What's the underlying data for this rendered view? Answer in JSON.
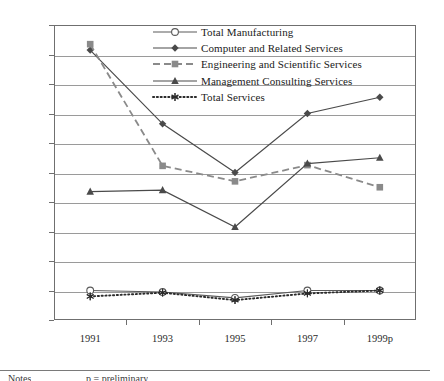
{
  "chart_data": {
    "type": "line",
    "title": "",
    "xlabel": "",
    "ylabel": "",
    "categories": [
      "1991",
      "1993",
      "1995",
      "1997",
      "1999p"
    ],
    "ylim": [
      0,
      20
    ],
    "ytick_step": 2,
    "ytick_labels": [
      "0.00",
      "2.00",
      "4.00",
      "6.00",
      "8.00",
      "10.00",
      "12.00",
      "14.00",
      "16.00",
      "18.00",
      "20.00"
    ],
    "grid": true,
    "legend_position": "top-center",
    "series": [
      {
        "name": "Total Manufacturing",
        "values": [
          2.0,
          1.9,
          1.5,
          2.0,
          2.0
        ],
        "marker": "open-circle",
        "line_style": "solid",
        "color": "#5a5a5a"
      },
      {
        "name": "Computer and Related Services",
        "values": [
          18.3,
          13.3,
          10.0,
          14.0,
          15.1
        ],
        "marker": "filled-diamond",
        "line_style": "solid",
        "color": "#4a4a4a"
      },
      {
        "name": "Engineering and Scientific Services",
        "values": [
          18.7,
          10.45,
          9.4,
          10.5,
          9.0
        ],
        "marker": "filled-square",
        "line_style": "dashed",
        "color": "#8a8a8a"
      },
      {
        "name": "Management Consulting Services",
        "values": [
          8.7,
          8.8,
          6.3,
          10.6,
          11.0
        ],
        "marker": "filled-triangle",
        "line_style": "solid",
        "color": "#4a4a4a"
      },
      {
        "name": "Total Services",
        "values": [
          1.6,
          1.85,
          1.35,
          1.8,
          2.0
        ],
        "marker": "asterisk",
        "line_style": "dotted",
        "color": "#2b2b2b"
      }
    ]
  },
  "footer": {
    "notes_label": "Notes",
    "prelim_label": "p = preliminary"
  }
}
